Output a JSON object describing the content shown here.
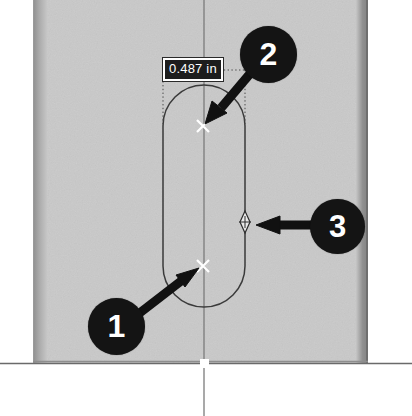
{
  "viewport": {
    "width": 412,
    "height": 416,
    "background_color": "#ffffff"
  },
  "model": {
    "material_face_color": "#c9c9c9",
    "shade_edge_color": "#8f8f8f",
    "sketch_line_color": "#3c3c3c",
    "centerline_color": "#7b7b7b",
    "description": "Shaded part face with a slot sketch and a vertical centerline"
  },
  "sketch": {
    "slot_shape": "stadium-slot",
    "center_marks": [
      {
        "name": "upper-slot-center",
        "x": 203,
        "y": 126
      },
      {
        "name": "lower-slot-center",
        "x": 203,
        "y": 266
      }
    ],
    "edge_point": {
      "name": "slot-right-edge-point",
      "x": 245,
      "y": 222
    },
    "origin_point": {
      "name": "sketch-origin",
      "x": 204,
      "y": 363
    }
  },
  "dimension": {
    "value_text": "0.487 in",
    "units": "in",
    "value": 0.487,
    "box_color": "#1d1d1d",
    "text_color": "#ffffff"
  },
  "callouts": [
    {
      "id": "1",
      "label": "1",
      "points_to": "lower-slot-center",
      "badge_color": "#141414",
      "text_color": "#ffffff"
    },
    {
      "id": "2",
      "label": "2",
      "points_to": "upper-slot-center",
      "badge_color": "#141414",
      "text_color": "#ffffff"
    },
    {
      "id": "3",
      "label": "3",
      "points_to": "slot-right-edge-point",
      "badge_color": "#141414",
      "text_color": "#ffffff"
    }
  ]
}
